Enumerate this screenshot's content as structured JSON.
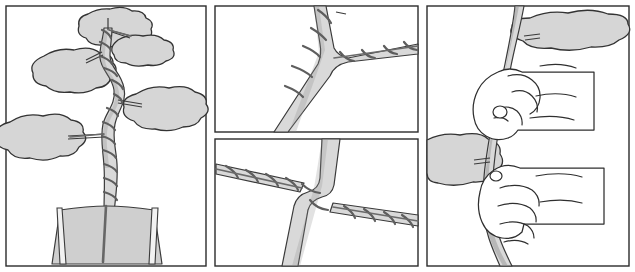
{
  "figure": {
    "caption": "",
    "panel_count": 4,
    "style": "line drawing with gray tone fill",
    "colors": {
      "background": "#ffffff",
      "outline": "#2b2b2b",
      "foliage_fill": "#d6d6d6",
      "trunk_fill": "#d9d9d9",
      "pot_fill": "#cfcfcf",
      "wire": "#5e5e5e",
      "hand_fill": "#ffffff"
    },
    "panels": [
      {
        "id": "panel-whole-tree",
        "label": "",
        "subject": "whole bonsai tree in pot with wired trunk and five foliage pads",
        "position": "left",
        "foliage_pad_count": 5,
        "elements": [
          "wired-trunk",
          "foliage-pads",
          "training-pot",
          "soil-line"
        ]
      },
      {
        "id": "panel-branch-junction-upper",
        "label": "",
        "subject": "close-up of wire coiled up trunk and continuing out along one branch",
        "position": "top-middle",
        "elements": [
          "trunk",
          "side-branch",
          "coiled-wire"
        ]
      },
      {
        "id": "panel-branch-junction-lower",
        "label": "",
        "subject": "close-up of one wire anchored on trunk running out to two opposite branches",
        "position": "bottom-middle",
        "elements": [
          "trunk",
          "left-branch",
          "right-branch",
          "coiled-wire"
        ]
      },
      {
        "id": "panel-hands",
        "label": "",
        "subject": "two hands gripping and bending the wired trunk, foliage pads visible",
        "position": "right",
        "foliage_pad_count": 2,
        "hand_count": 2,
        "elements": [
          "upper-hand",
          "lower-hand",
          "trunk",
          "foliage-pads"
        ]
      }
    ]
  }
}
